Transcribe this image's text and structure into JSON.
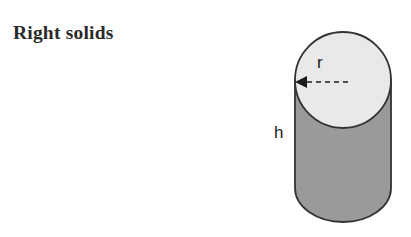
{
  "page": {
    "title": "Right solids",
    "background_color": "#ffffff",
    "width": 411,
    "height": 237
  },
  "figure": {
    "name": "right-circular-cylinder",
    "shape": "cylinder",
    "top_face_color": "#e9e9e9",
    "body_color": "#9a9a9a",
    "outline_color": "#333333",
    "labels": {
      "radius": "r",
      "height": "h"
    },
    "annotations": {
      "radius_arrow": {
        "icon": "dashed-arrow-left-icon",
        "style": "dashed",
        "direction": "left"
      }
    }
  }
}
